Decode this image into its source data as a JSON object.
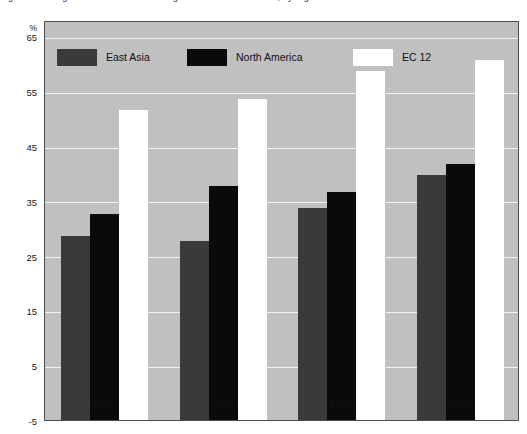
{
  "title": "Figure 1. Changes in the share of intra-regional trade in total trade, by region",
  "axes": {
    "y_unit": "%",
    "y_ticks": [
      65,
      55,
      45,
      35,
      25,
      15,
      5,
      -5
    ],
    "y_min": -5,
    "y_max": 68,
    "x_ticks": [
      "1980",
      "1985",
      "1990",
      "1995"
    ]
  },
  "legend": {
    "items": [
      {
        "label": "East Asia",
        "color": "#3a3a3a",
        "swatch": "east-asia"
      },
      {
        "label": "North America",
        "color": "#0a0a0a",
        "swatch": "north-am"
      },
      {
        "label": "EC 12",
        "color": "#ffffff",
        "swatch": "ec12"
      }
    ]
  },
  "chart_data": {
    "type": "bar",
    "title": "Figure 1. Changes in the share of intra-regional trade in total trade, by region",
    "xlabel": "",
    "ylabel": "%",
    "ylim": [
      -5,
      68
    ],
    "grid": true,
    "legend_position": "top",
    "categories": [
      "1980",
      "1985",
      "1990",
      "1995"
    ],
    "series": [
      {
        "name": "East Asia",
        "color": "#3a3a3a",
        "values": [
          29,
          28,
          34,
          40
        ]
      },
      {
        "name": "North America",
        "color": "#0a0a0a",
        "values": [
          33,
          38,
          37,
          42
        ]
      },
      {
        "name": "EC 12",
        "color": "#ffffff",
        "values": [
          52,
          54,
          59,
          61
        ]
      }
    ]
  }
}
